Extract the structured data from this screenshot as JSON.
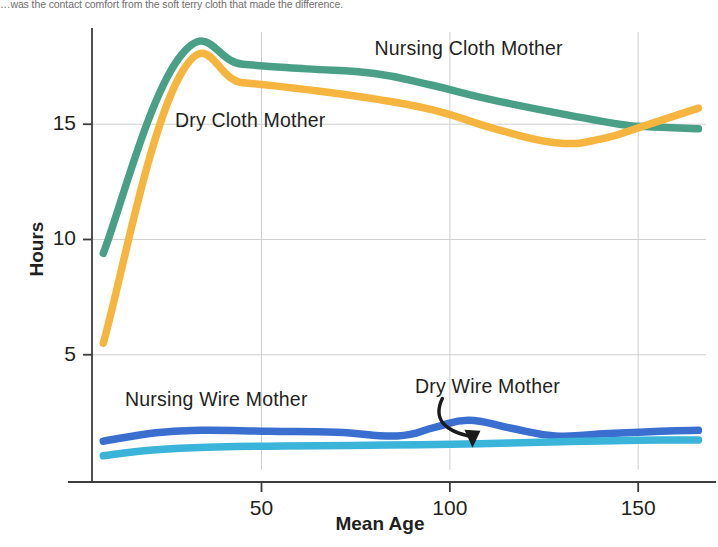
{
  "caption": {
    "text": "…was the contact comfort from the soft terry cloth that made the difference."
  },
  "chart_data": {
    "type": "line",
    "title": "",
    "xlabel": "Mean Age",
    "ylabel": "Hours",
    "xlim": [
      5,
      168
    ],
    "ylim": [
      0,
      19
    ],
    "xticks": [
      50,
      100,
      150
    ],
    "yticks": [
      5,
      10,
      15
    ],
    "xtick_labels": [
      "50",
      "100",
      "150"
    ],
    "ytick_labels": [
      "5",
      "10",
      "15"
    ],
    "grid": true,
    "legend_position": "inline-annotations",
    "series": [
      {
        "name": "Nursing Cloth Mother",
        "color": "#4a9f87",
        "label_x": 105,
        "label_y": 18.2,
        "x": [
          8,
          28,
          45,
          62,
          80,
          95,
          110,
          128,
          145,
          152,
          166
        ],
        "y": [
          9.4,
          17.85,
          17.6,
          17.4,
          17.2,
          16.7,
          16.1,
          15.5,
          15.0,
          14.9,
          14.8
        ]
      },
      {
        "name": "Dry Cloth Mother",
        "color": "#f5b53f",
        "label_x": 47,
        "label_y": 15.1,
        "x": [
          8,
          28,
          45,
          62,
          80,
          96,
          112,
          128,
          140,
          152,
          166
        ],
        "y": [
          5.5,
          17.0,
          16.8,
          16.5,
          16.1,
          15.6,
          14.8,
          14.2,
          14.35,
          14.95,
          15.7
        ]
      },
      {
        "name": "Nursing Wire Mother",
        "color": "#3a6fd0",
        "label_x": 38,
        "label_y": 3.0,
        "x": [
          8,
          22,
          34,
          52,
          70,
          86,
          96,
          105,
          116,
          128,
          142,
          156,
          166
        ],
        "y": [
          1.25,
          1.62,
          1.72,
          1.68,
          1.64,
          1.48,
          1.85,
          2.16,
          1.82,
          1.48,
          1.58,
          1.68,
          1.72
        ]
      },
      {
        "name": "Dry Wire Mother",
        "color": "#3ab5d9",
        "label_x": 110,
        "label_y": 3.55,
        "x": [
          8,
          22,
          38,
          56,
          74,
          92,
          108,
          124,
          140,
          156,
          166
        ],
        "y": [
          0.62,
          0.88,
          1.0,
          1.04,
          1.06,
          1.1,
          1.14,
          1.2,
          1.26,
          1.3,
          1.3
        ]
      }
    ],
    "annotations": [
      {
        "name": "dry-wire-mother-arrow",
        "label": "Dry Wire Mother",
        "from_x": 98,
        "from_y": 3.1,
        "to_x": 106,
        "to_y": 1.05
      }
    ]
  },
  "colors": {
    "nursing_cloth": "#4a9f87",
    "dry_cloth": "#f5b53f",
    "nursing_wire": "#3a6fd0",
    "dry_wire": "#3ab5d9",
    "axis": "#3d3d3d",
    "grid": "#cfcfcf",
    "text": "#231f20"
  }
}
